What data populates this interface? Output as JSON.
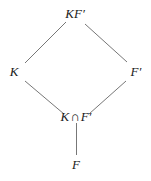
{
  "diagram": {
    "type": "field-lattice",
    "stroke_color": "#777777",
    "text_color": "#1a1a1a",
    "nodes": {
      "top": {
        "id": "KF'",
        "label_main": "KF",
        "label_prime": "′"
      },
      "left": {
        "id": "K",
        "label_main": "K"
      },
      "right": {
        "id": "F'",
        "label_main": "F",
        "label_prime": "′"
      },
      "middle": {
        "id": "K∩F'",
        "label_left": "K",
        "label_op": "∩",
        "label_right": "F",
        "label_prime": "′"
      },
      "bottom": {
        "id": "F",
        "label_main": "F"
      }
    },
    "edges": [
      {
        "from": "K",
        "to": "KF'"
      },
      {
        "from": "F'",
        "to": "KF'"
      },
      {
        "from": "K∩F'",
        "to": "K"
      },
      {
        "from": "K∩F'",
        "to": "F'"
      },
      {
        "from": "F",
        "to": "K∩F'"
      }
    ]
  }
}
